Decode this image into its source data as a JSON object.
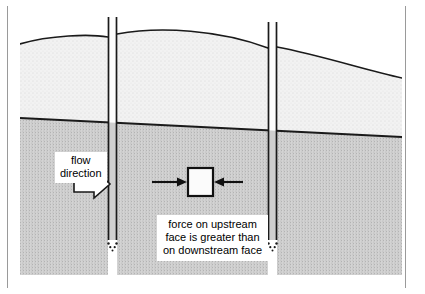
{
  "figure": {
    "name": "seepage-force-diagram"
  },
  "labels": {
    "flow_direction": "flow\ndirection",
    "caption": "force on upstream\nface is greater than\non downstream face"
  },
  "elements": {
    "soil_block_name": "soil-element-square",
    "flow_arrow_name": "flow-direction-arrow",
    "upstream_force_arrow_name": "upstream-force-arrow",
    "downstream_force_arrow_name": "downstream-force-arrow",
    "water_table_name": "water-table-line",
    "ground_surface_name": "ground-surface-line",
    "left_standpipe_name": "left-standpipe",
    "right_standpipe_name": "right-standpipe"
  },
  "colors": {
    "ink": "#111111",
    "frame": "#9a9a9a",
    "soil_dry": "#efefef",
    "soil_saturated": "#c9c9c9",
    "fill_white": "#ffffff"
  },
  "geometry": {
    "canvas": {
      "width": 425,
      "height": 294
    },
    "scene": {
      "x": 20,
      "y": 12,
      "width": 382,
      "height": 263
    },
    "water_table": {
      "left_y": 118,
      "right_y": 137
    },
    "left_standpipe": {
      "outer_x": 108,
      "inner_x": 117,
      "top_y": 17,
      "bottom_y": 240
    },
    "right_standpipe": {
      "outer_x": 268,
      "inner_x": 277,
      "top_y": 22,
      "bottom_y": 240
    },
    "soil_element": {
      "x": 188,
      "y": 168,
      "width": 24,
      "height": 28
    },
    "upstream_arrow": {
      "x1": 152,
      "x2": 186,
      "y": 182
    },
    "downstream_arrow": {
      "x1": 243,
      "x2": 214,
      "y": 182
    }
  }
}
